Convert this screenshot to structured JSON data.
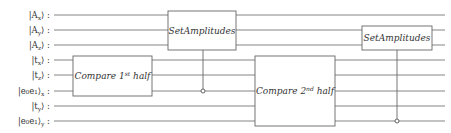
{
  "diagram": {
    "type": "quantum-circuit",
    "qubits": [
      {
        "id": "Ax",
        "ket": "A",
        "sub": "x",
        "outer_sub": ""
      },
      {
        "id": "Ay",
        "ket": "A",
        "sub": "y",
        "outer_sub": ""
      },
      {
        "id": "Az",
        "ket": "A",
        "sub": "z",
        "outer_sub": ""
      },
      {
        "id": "tx",
        "ket": "t",
        "sub": "x",
        "outer_sub": ""
      },
      {
        "id": "tz",
        "ket": "t",
        "sub": "z",
        "outer_sub": ""
      },
      {
        "id": "e0e1x",
        "ket": "e₀e₁",
        "sub": "",
        "outer_sub": "x"
      },
      {
        "id": "ty",
        "ket": "t",
        "sub": "y",
        "outer_sub": ""
      },
      {
        "id": "e0e1y",
        "ket": "e₀e₁",
        "sub": "",
        "outer_sub": "y"
      }
    ],
    "gates": [
      {
        "id": "compare-1st-half",
        "label_main": "Compare 1",
        "label_sup": "st",
        "label_tail": " half",
        "targets": [
          3,
          5
        ],
        "control": null
      },
      {
        "id": "set-amplitudes-1",
        "label_main": "SetAmplitudes",
        "label_sup": "",
        "label_tail": "",
        "targets": [
          0,
          2
        ],
        "control": 5
      },
      {
        "id": "compare-2nd-half",
        "label_main": "Compare 2",
        "label_sup": "nd",
        "label_tail": " half",
        "targets": [
          3,
          7
        ],
        "control": null
      },
      {
        "id": "set-amplitudes-2",
        "label_main": "SetAmplitudes",
        "label_sup": "",
        "label_tail": "",
        "targets": [
          1,
          2
        ],
        "control": 7
      }
    ],
    "colon": ":"
  }
}
